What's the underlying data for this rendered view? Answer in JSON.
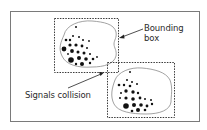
{
  "diagram": {
    "labels": {
      "bounding_box_line1": "Bounding",
      "bounding_box_line2": "box",
      "signals_collision": "Signals collision"
    },
    "colors": {
      "frame": "#7a7a7a",
      "dashed_box": "#3a3a3a",
      "cell_outline": "#8a8a8a",
      "dots": "#111111",
      "text": "#2a2a2a"
    },
    "elements": [
      {
        "id": "cell-1",
        "type": "blob-with-dots",
        "bounding_box": {
          "x": 54,
          "y": 18,
          "w": 64,
          "h": 54
        }
      },
      {
        "id": "cell-2",
        "type": "blob-with-dots",
        "bounding_box": {
          "x": 107,
          "y": 62,
          "w": 67,
          "h": 55
        }
      }
    ],
    "annotations": [
      {
        "label": "Bounding box",
        "points_to": "cell-1 bounding box right edge"
      },
      {
        "label": "Signals collision",
        "points_to": "overlap of bounding boxes"
      }
    ]
  }
}
